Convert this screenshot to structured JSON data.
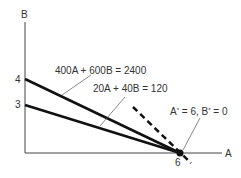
{
  "axes": {
    "y_label": "B",
    "x_label": "A",
    "y_ticks": [
      "4",
      "3"
    ],
    "x_ticks": [
      "6"
    ]
  },
  "constraints": [
    {
      "label": "400A + 600B = 2400",
      "b_intercept": 4,
      "a_intercept": 6
    },
    {
      "label": "20A + 40B = 120",
      "b_intercept": 3,
      "a_intercept": 6
    }
  ],
  "objective_line": {
    "style": "dashed"
  },
  "optimum": {
    "label": "A* = 6, B* = 0",
    "a": 6,
    "b": 0
  },
  "colors": {
    "line": "#111111",
    "axis": "#444444",
    "text": "#333333"
  }
}
